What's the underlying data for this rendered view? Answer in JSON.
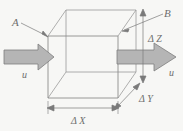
{
  "figure": {
    "type": "3d-control-volume-diagram",
    "caption": "",
    "labels": {
      "face_left": "A",
      "face_right": "B",
      "velocity_left": "u",
      "velocity_right": "u",
      "dim_x": "Δ X",
      "dim_y": "Δ Y",
      "dim_z": "Δ Z"
    },
    "colors": {
      "background": "#f7f7f5",
      "cube_edge": "#8c8c8c",
      "arrow_fill": "#b3b3b3",
      "arrow_stroke": "#7a7a7a",
      "annotation": "#6e6e6e",
      "text": "#6e6e6e"
    },
    "geometry": {
      "front_face": "x:48-118, y:36-98",
      "depth_offset": "dx:+18, dy:-26"
    }
  }
}
